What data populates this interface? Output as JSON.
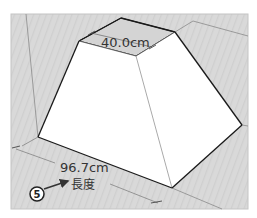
{
  "diagram": {
    "top_dimension": "40.0cm",
    "bottom_dimension": "96.7cm",
    "measure_label": "長度",
    "step_badge": "5",
    "colors": {
      "background": "#d6d6d6",
      "face": "#ffffff",
      "edge": "#1a1a1a",
      "guide": "#7a7a7a",
      "frame": "#c8c8c8"
    }
  }
}
